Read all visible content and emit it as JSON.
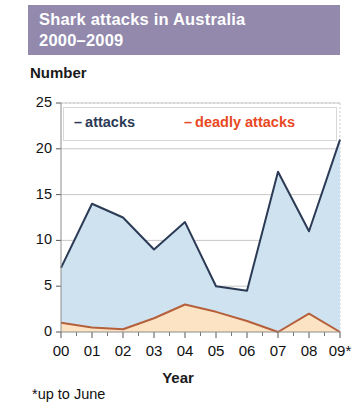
{
  "title": {
    "line1": "Shark attacks in Australia",
    "line2": "2000–2009",
    "banner_color": "#9289ad",
    "text_color": "#ffffff"
  },
  "axis": {
    "y_title": "Number",
    "x_title": "Year"
  },
  "legend": {
    "dash": "–",
    "attacks_label": "attacks",
    "deadly_label": "deadly attacks",
    "attacks_color": "#2b3a55",
    "deadly_color": "#e8491f"
  },
  "footnote": "*up to June",
  "chart_data": {
    "type": "area",
    "title": "Shark attacks in Australia 2000–2009",
    "xlabel": "Year",
    "ylabel": "Number",
    "categories": [
      "00",
      "01",
      "02",
      "03",
      "04",
      "05",
      "06",
      "07",
      "08",
      "09*"
    ],
    "x_tick_labels": [
      "00",
      "01",
      "02",
      "03",
      "04",
      "05",
      "06",
      "07",
      "08",
      "09*"
    ],
    "y_tick_labels": [
      "0",
      "5",
      "10",
      "15",
      "20",
      "25"
    ],
    "y_ticks": [
      0,
      5,
      10,
      15,
      20,
      25
    ],
    "ylim": [
      0,
      25
    ],
    "grid": true,
    "legend_position": "top-inside",
    "series": [
      {
        "name": "attacks",
        "color": "#2b3a55",
        "fill": "#cfe2f0",
        "values": [
          7,
          14,
          12.5,
          9,
          12,
          5,
          4.5,
          17.5,
          11,
          21
        ]
      },
      {
        "name": "deadly attacks",
        "color": "#b5603a",
        "fill": "#fbe3c4",
        "values": [
          1,
          0.5,
          0.3,
          1.5,
          3,
          2.2,
          1.2,
          0,
          2,
          0
        ]
      }
    ],
    "annotations": [
      "*up to June"
    ]
  }
}
